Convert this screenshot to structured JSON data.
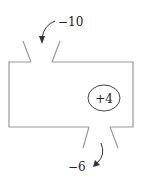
{
  "diagram": {
    "inflow_label": "−10",
    "inside_label": "+4",
    "outflow_label": "−6",
    "stroke_color": "#9a9a9a",
    "arrow_color": "#333333"
  }
}
